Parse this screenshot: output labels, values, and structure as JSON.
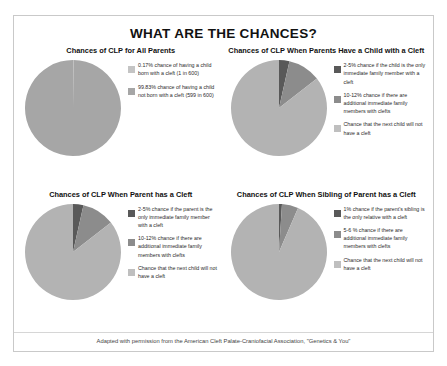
{
  "poster": {
    "title": "WHAT ARE THE CHANCES?",
    "footer": "Adapted with permission from the American Cleft Palate-Craniofacial Association, \"Genetics & You\""
  },
  "colors": {
    "dark": "#595959",
    "medium": "#8c8c8c",
    "light": "#bfbfbf"
  },
  "chart_data": [
    {
      "type": "pie",
      "id": "chart-all-parents",
      "title": "Chances of CLP for All Parents",
      "categories": [
        "0.17% chance of having a child born with a cleft (1 in 600)",
        "99.83% chance of having a child not born with a cleft (599 in 600)"
      ],
      "values": [
        0.17,
        99.83
      ],
      "slice_colors": [
        "#bfbfbf",
        "#a6a6a6"
      ],
      "legend": [
        {
          "swatch": "#c4c4c4",
          "label": "0.17% chance of having a child born with a cleft (1 in 600)"
        },
        {
          "swatch": "#a6a6a6",
          "label": "99.83% chance of having a child not born with a cleft (599 in 600)"
        }
      ],
      "legend_position": "right"
    },
    {
      "type": "pie",
      "id": "chart-parents-have-child-with-cleft",
      "title": "Chances of CLP When Parents Have a Child with a Cleft",
      "categories": [
        "2-5% chance if the child is the only immediate family member with a cleft",
        "10-12% chance if there are additional immediate family members with clefts",
        "Chance that the next child will not have a cleft"
      ],
      "values": [
        3.5,
        11.0,
        85.5
      ],
      "slice_colors": [
        "#595959",
        "#8c8c8c",
        "#b3b3b3"
      ],
      "legend": [
        {
          "swatch": "#595959",
          "label": "2-5% chance if the child is the only immediate family member with a cleft"
        },
        {
          "swatch": "#8c8c8c",
          "label": "10-12% chance if there are additional immediate family members with clefts"
        },
        {
          "swatch": "#bfbfbf",
          "label": "Chance that the next child will not have a cleft"
        }
      ],
      "legend_position": "right"
    },
    {
      "type": "pie",
      "id": "chart-parent-has-cleft",
      "title": "Chances of CLP When Parent has a Cleft",
      "categories": [
        "2-5% chance if the parent is the only immediate family member with a cleft",
        "10-12% chance if there are additional immediate family members with clefts",
        "Chance that the next child will not have a cleft"
      ],
      "values": [
        3.5,
        11.0,
        85.5
      ],
      "slice_colors": [
        "#595959",
        "#8c8c8c",
        "#b3b3b3"
      ],
      "legend": [
        {
          "swatch": "#595959",
          "label": "2-5% chance if the parent is the only immediate family member with a cleft"
        },
        {
          "swatch": "#8c8c8c",
          "label": "10-12% chance if there are additional immediate family members with clefts"
        },
        {
          "swatch": "#bfbfbf",
          "label": "Chance that the next child will not have a cleft"
        }
      ],
      "legend_position": "right"
    },
    {
      "type": "pie",
      "id": "chart-sibling-of-parent-has-cleft",
      "title": "Chances of CLP When Sibling of Parent has a Cleft",
      "categories": [
        "1% chance if the parent's sibling is the only relative with a cleft",
        "5-6 % chance if there are additional immediate family members with clefts",
        "Chance that the next child will not have a cleft"
      ],
      "values": [
        1.0,
        5.5,
        93.5
      ],
      "slice_colors": [
        "#595959",
        "#8c8c8c",
        "#b3b3b3"
      ],
      "legend": [
        {
          "swatch": "#595959",
          "label": "1% chance if the parent's sibling is the only relative with a cleft"
        },
        {
          "swatch": "#8c8c8c",
          "label": "5-6 % chance if there are additional immediate family members with clefts"
        },
        {
          "swatch": "#bfbfbf",
          "label": "Chance that the next child will not have a cleft"
        }
      ],
      "legend_position": "right"
    }
  ]
}
